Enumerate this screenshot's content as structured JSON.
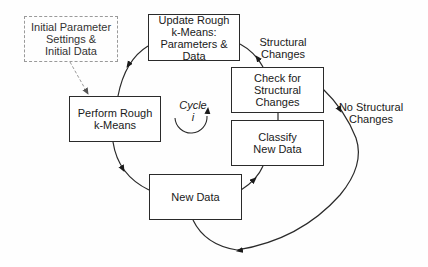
{
  "diagram": {
    "nodes": [
      {
        "id": "init",
        "label": "Initial Parameter\nSettings &\nInitial Data",
        "style": "dashed"
      },
      {
        "id": "perform",
        "label": "Perform Rough\nk-Means",
        "style": "solid"
      },
      {
        "id": "update",
        "label": "Update Rough\nk-Means:\nParameters & Data",
        "style": "solid"
      },
      {
        "id": "check",
        "label": "Check for\nStructural\nChanges",
        "style": "solid"
      },
      {
        "id": "classify",
        "label": "Classify\nNew Data",
        "style": "solid"
      },
      {
        "id": "newdata",
        "label": "New Data",
        "style": "solid"
      }
    ],
    "edges": [
      {
        "from": "init",
        "to": "perform",
        "style": "dashed",
        "label": ""
      },
      {
        "from": "update",
        "to": "perform",
        "style": "solid",
        "label": ""
      },
      {
        "from": "perform",
        "to": "newdata",
        "style": "solid",
        "label": ""
      },
      {
        "from": "newdata",
        "to": "classify",
        "style": "solid",
        "label": ""
      },
      {
        "from": "check",
        "to": "update",
        "style": "solid",
        "label": "Structural\nChanges"
      },
      {
        "from": "check",
        "to": "newdata",
        "style": "solid",
        "label": "No Structural\nChanges"
      }
    ],
    "edge_labels": {
      "structural": "Structural\nChanges",
      "no_structural": "No Structural\nChanges"
    },
    "cycle": {
      "word": "Cycle",
      "index": "i"
    },
    "colors": {
      "line": "#2a2a2a",
      "dashed": "#9a9a9a",
      "background": "#fefefe"
    }
  }
}
